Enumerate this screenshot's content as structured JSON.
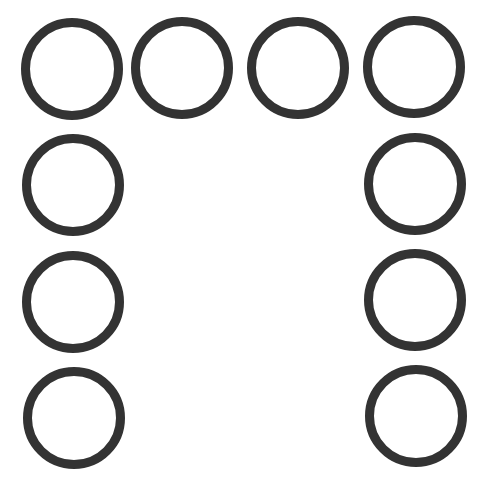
{
  "canvas": {
    "width": 486,
    "height": 504,
    "background": "#ffffff"
  },
  "style": {
    "ring_color": "#333333",
    "ring_stroke": 9,
    "ring_diameter": 102
  },
  "rings": [
    {
      "id": "ring-row1-col1",
      "cx": 72,
      "cy": 69
    },
    {
      "id": "ring-row1-col2",
      "cx": 182,
      "cy": 68
    },
    {
      "id": "ring-row1-col3",
      "cx": 298,
      "cy": 68
    },
    {
      "id": "ring-row1-col4",
      "cx": 414,
      "cy": 67
    },
    {
      "id": "ring-row2-col1",
      "cx": 73,
      "cy": 185
    },
    {
      "id": "ring-row2-col4",
      "cx": 415,
      "cy": 184
    },
    {
      "id": "ring-row3-col1",
      "cx": 73,
      "cy": 302
    },
    {
      "id": "ring-row3-col4",
      "cx": 415,
      "cy": 300
    },
    {
      "id": "ring-row4-col1",
      "cx": 74,
      "cy": 418
    },
    {
      "id": "ring-row4-col4",
      "cx": 416,
      "cy": 416
    }
  ],
  "layout": {
    "shape": "inverted-U arrangement of 10 rings",
    "count": 10
  }
}
